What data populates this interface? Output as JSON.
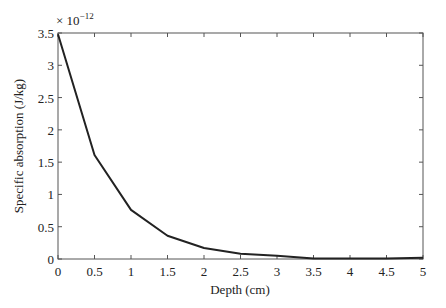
{
  "chart_data": {
    "type": "line",
    "title": "",
    "xlabel": "Depth (cm)",
    "ylabel": "Specific absorption (J/kg)",
    "y_multiplier": "× 10",
    "y_exponent": "−12",
    "xlim": [
      0,
      5
    ],
    "ylim": [
      0,
      3.5
    ],
    "x_ticks": [
      0,
      0.5,
      1,
      1.5,
      2,
      2.5,
      3,
      3.5,
      4,
      4.5,
      5
    ],
    "x_tick_labels": [
      "0",
      "0.5",
      "1",
      "1.5",
      "2",
      "2.5",
      "3",
      "3.5",
      "4",
      "4.5",
      "5"
    ],
    "y_ticks": [
      0,
      0.5,
      1,
      1.5,
      2,
      2.5,
      3,
      3.5
    ],
    "y_tick_labels": [
      "0",
      "0.5",
      "1",
      "1.5",
      "2",
      "2.5",
      "3",
      "3.5"
    ],
    "grid": false,
    "series": [
      {
        "name": "Specific absorption",
        "color": "#222222",
        "x": [
          0,
          0.5,
          1,
          1.5,
          2,
          2.5,
          3,
          3.5,
          4,
          4.5,
          5
        ],
        "values": [
          3.48,
          1.61,
          0.76,
          0.36,
          0.17,
          0.08,
          0.05,
          0.01,
          0.01,
          0.01,
          0.02
        ]
      }
    ]
  }
}
